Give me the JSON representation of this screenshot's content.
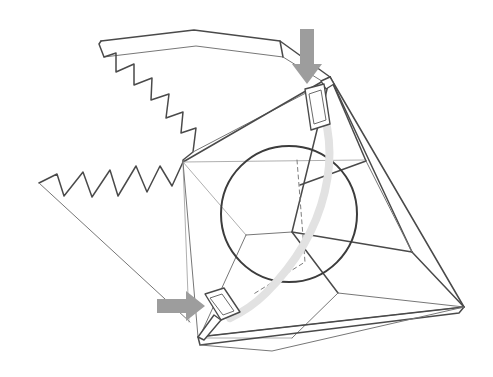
{
  "figure": {
    "type": "technical-line-drawing",
    "background_color": "#ffffff",
    "canvas": {
      "width": 493,
      "height": 377
    },
    "palette": {
      "line_primary": "#4a4a4a",
      "line_secondary": "#777777",
      "line_faint": "#9a9a9a",
      "hidden_edge": "#7d7d7d",
      "strap": "#e2e2e2",
      "arrow": "#9d9d9d",
      "background": "#ffffff"
    },
    "caption": "",
    "elements": {
      "top_flap_label": "torn top flap",
      "left_flap_label": "torn left flap",
      "sphere_label": "internal sphere",
      "strap_label": "tensioning strap",
      "top_buckle_label": "upper buckle",
      "bottom_buckle_label": "lower buckle",
      "down_arrow_label": "downward force arrow",
      "right_arrow_label": "rightward force arrow",
      "body_label": "faceted container body"
    }
  },
  "geometry": {
    "top_flap": {
      "outline": "M 101 41 L 99 44 L 104 57 L 116 53 L 116 72 L 134 64 L 134 85 L 152 78 L 151 100 L 169 94 L 166 118 L 183 112 L 181 133 L 196 128 L 193 152 L 183 160 L 183 162",
      "fold_top": "M 101 41 L 194 30 L 280 41 L 330 77",
      "fold_inner": "M 104 57 L 196 46 L 283 57 L 325 83",
      "right_edge": "M 280 41 L 283 57",
      "lower_edge": "M 193 152 L 325 83"
    },
    "left_flap": {
      "outline": "M 39 183 L 57 174 L 64 196 L 83 172 L 92 197 L 110 170 L 118 196 L 136 166 L 147 192 L 160 166 L 172 186 L 183 162",
      "lower_edge": "M 39 183 L 186 320",
      "tip_edge": "M 183 162 L 186 320"
    },
    "body": {
      "hub_left": [
        183,
        162
      ],
      "hub_top": [
        330,
        77
      ],
      "hub_bottom": [
        198,
        337
      ],
      "hub_right": [
        464,
        307
      ],
      "edges": [
        "M 330 77 L 183 162",
        "M 183 162 L 198 337",
        "M 330 77 L 464 307",
        "M 198 337 L 464 307",
        "M 183 162 L 364 160",
        "M 183 162 L 240 232",
        "M 330 77 L 364 160",
        "M 364 160 L 306 190",
        "M 330 77 L 290 230",
        "M 290 230 L 336 292",
        "M 336 292 L 464 307",
        "M 290 230 L 240 232",
        "M 240 232 L 198 337",
        "M 336 292 L 290 337",
        "M 290 337 L 198 337",
        "M 330 77 L 410 250",
        "M 410 250 L 464 307",
        "M 290 230 L 410 250"
      ],
      "base_band": "M 198 337 L 464 307 L 459 313 L 200 345 Z",
      "base_band_inner": "M 200 345 L 272 351 L 464 307",
      "hidden": "M 290 155 L 300 265 L 250 300"
    },
    "sphere": {
      "cx": 289,
      "cy": 214,
      "r": 68,
      "stroke": "#3c3c3c"
    },
    "strap": {
      "path": "M 322 92 M 318 96 C 345 150 330 230 268 292 C 255 305 243 313 232 318",
      "path_main": "M 316 94 C 344 152 328 231 266 293 C 253 306 241 313 230 318",
      "top_anchor": [
        316,
        94
      ],
      "bottom_anchor": [
        230,
        318
      ]
    },
    "top_buckle": {
      "outer": "M 305 89 L 324 84 L 330 124 L 311 130 Z",
      "inner": "M 309 94 L 321 90 L 326 120 L 314 124 Z",
      "stem": "M 322 82 L 330 77 L 333 82 L 326 88 Z"
    },
    "bottom_buckle": {
      "outer": "M 205 294 L 224 288 L 240 312 L 221 320 Z",
      "inner": "M 210 298 L 222 294 L 234 311 L 223 315 Z",
      "stem": "M 215 316 L 198 337 L 204 339 L 222 320 Z"
    },
    "arrows": {
      "down": {
        "path": "M 300 29 L 314 29 L 314 64 L 322 64 L 307 84 L 292 64 L 300 64 Z",
        "direction": "down"
      },
      "right": {
        "path": "M 157 299 L 186 299 L 186 291 L 205 306 L 186 321 L 186 313 L 157 313 Z",
        "direction": "right"
      }
    }
  }
}
